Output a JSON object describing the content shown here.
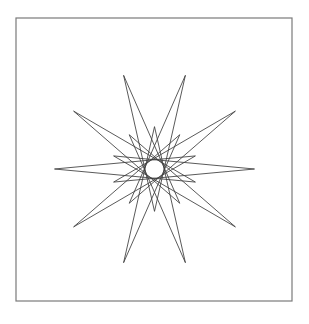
{
  "page": {
    "background_color": "#ffffff",
    "width": 309,
    "height": 324
  },
  "frame": {
    "name": "outer-border",
    "x": 16,
    "y": 18,
    "width": 276,
    "height": 283,
    "stroke_color": "#7a7a7a",
    "stroke_width": 1.2,
    "fill": "none"
  },
  "chart_data": {
    "type": "line",
    "subtitle": "",
    "xlabel": "",
    "ylabel": "",
    "grid": false,
    "legend": null,
    "axes_visible": false,
    "tick_labels": [],
    "annotations": [],
    "geometry": {
      "description": "Closed polyline connecting 20 vertices alternating between a large radius and a small radius, traversed with a step of 9 vertices per chord, producing 10 long spikes interleaved with 10 short lobes plus a flat lens across the horizontal center.",
      "center_x": 154.5,
      "center_y": 169.0,
      "point_count": 20,
      "step": 9,
      "radius_long": 100.0,
      "radius_short": 43.0,
      "rotation_degrees": -108.0,
      "squash_y": 0.985,
      "stroke_color": "#3c3c3c",
      "stroke_width": 0.85,
      "fill": "none"
    },
    "vertices_polar": [
      {
        "index": 0,
        "radius": 100.0,
        "angle_deg": -108.0
      },
      {
        "index": 1,
        "radius": 43.0,
        "angle_deg": -90.0
      },
      {
        "index": 2,
        "radius": 100.0,
        "angle_deg": -72.0
      },
      {
        "index": 3,
        "radius": 43.0,
        "angle_deg": -54.0
      },
      {
        "index": 4,
        "radius": 100.0,
        "angle_deg": -36.0
      },
      {
        "index": 5,
        "radius": 43.0,
        "angle_deg": -18.0
      },
      {
        "index": 6,
        "radius": 100.0,
        "angle_deg": 0.0
      },
      {
        "index": 7,
        "radius": 43.0,
        "angle_deg": 18.0
      },
      {
        "index": 8,
        "radius": 100.0,
        "angle_deg": 36.0
      },
      {
        "index": 9,
        "radius": 43.0,
        "angle_deg": 54.0
      },
      {
        "index": 10,
        "radius": 100.0,
        "angle_deg": 72.0
      },
      {
        "index": 11,
        "radius": 43.0,
        "angle_deg": 90.0
      },
      {
        "index": 12,
        "radius": 100.0,
        "angle_deg": 108.0
      },
      {
        "index": 13,
        "radius": 43.0,
        "angle_deg": 126.0
      },
      {
        "index": 14,
        "radius": 100.0,
        "angle_deg": 144.0
      },
      {
        "index": 15,
        "radius": 43.0,
        "angle_deg": 162.0
      },
      {
        "index": 16,
        "radius": 100.0,
        "angle_deg": 180.0
      },
      {
        "index": 17,
        "radius": 43.0,
        "angle_deg": 198.0
      },
      {
        "index": 18,
        "radius": 100.0,
        "angle_deg": 216.0
      },
      {
        "index": 19,
        "radius": 43.0,
        "angle_deg": 234.0
      }
    ],
    "spike_tips_observed": [
      {
        "label": "top-left-spike",
        "x": 113,
        "y": 65
      },
      {
        "label": "top-right-spike",
        "x": 200,
        "y": 65
      },
      {
        "label": "left-upper-spike",
        "x": 58,
        "y": 120
      },
      {
        "label": "right-upper-spike",
        "x": 250,
        "y": 122
      },
      {
        "label": "left-lower-spike",
        "x": 61,
        "y": 207
      },
      {
        "label": "right-lower-spike",
        "x": 250,
        "y": 207
      },
      {
        "label": "bottom-left-spike",
        "x": 114,
        "y": 262
      },
      {
        "label": "bottom-right-spike",
        "x": 200,
        "y": 262
      }
    ],
    "lobe_tips_observed": [
      {
        "label": "upper-left-lobe",
        "x": 122,
        "y": 120
      },
      {
        "label": "upper-right-lobe",
        "x": 188,
        "y": 118
      },
      {
        "label": "lower-left-lobe",
        "x": 118,
        "y": 205
      },
      {
        "label": "lower-right-lobe",
        "x": 193,
        "y": 205
      },
      {
        "label": "left-flat-lens",
        "x": 97,
        "y": 167
      },
      {
        "label": "right-flat-lens",
        "x": 212,
        "y": 168
      }
    ]
  }
}
